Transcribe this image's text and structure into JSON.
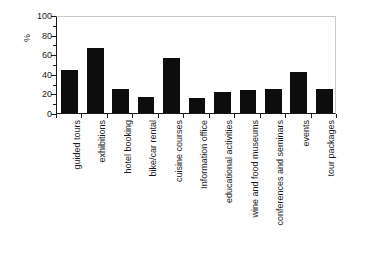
{
  "chart_data": {
    "type": "bar",
    "title": "",
    "subtitle": "",
    "xlabel": "",
    "ylabel": "%",
    "ylim": [
      0,
      100
    ],
    "y_ticks": [
      0,
      20,
      40,
      60,
      80,
      100
    ],
    "y_minor_ticks": [
      10,
      30,
      50,
      70,
      90
    ],
    "grid": false,
    "legend": null,
    "bar_color": "#0d0d0d",
    "axis_color": "#1a1a1a",
    "frame_color": "#c8c8c8",
    "categories": [
      "guided tours",
      "exhibitions",
      "hotel booking",
      "bike/car rental",
      "cuisine courses",
      "Information office",
      "educational activities",
      "wine and food museums",
      "conferences and seminars",
      "events",
      "tour packages"
    ],
    "values": [
      44,
      66,
      25,
      16,
      56,
      15,
      21,
      23,
      25,
      42,
      24
    ]
  }
}
